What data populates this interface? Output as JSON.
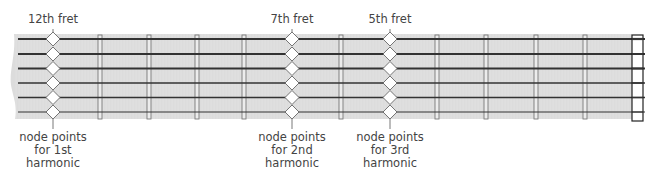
{
  "diagram": {
    "type": "guitar-fretboard-harmonics",
    "colors": {
      "fretboard": "#dcdcdc",
      "string": "#333333",
      "fret": "#7a7a7a",
      "node_fill": "#ffffff",
      "node_stroke": "#555555",
      "text": "#444444",
      "nut_fill": "#ffffff",
      "nut_stroke": "#222222"
    },
    "fretboard": {
      "x0": 12,
      "x1": 632,
      "y0": 34,
      "y1": 119
    },
    "nut": {
      "x": 632,
      "y": 35,
      "width": 11,
      "height": 86
    },
    "strings": [
      {
        "y": 39,
        "width": 2.2
      },
      {
        "y": 54,
        "width": 2.0
      },
      {
        "y": 68.5,
        "width": 1.8
      },
      {
        "y": 83,
        "width": 1.5
      },
      {
        "y": 97.5,
        "width": 1.3
      },
      {
        "y": 112,
        "width": 1.1
      }
    ],
    "frets_x": [
      100,
      149,
      197,
      244,
      341,
      437,
      486,
      536,
      585
    ],
    "node_frets": [
      {
        "fret": "12th fret",
        "x": 53,
        "bottom_label": [
          "node points",
          "for 1st",
          "harmonic"
        ]
      },
      {
        "fret": "7th fret",
        "x": 292,
        "bottom_label": [
          "node points",
          "for 2nd",
          "harmonic"
        ]
      },
      {
        "fret": "5th fret",
        "x": 390,
        "bottom_label": [
          "node points",
          "for 3rd",
          "harmonic"
        ]
      }
    ]
  },
  "labels": {
    "top": {
      "fret12": "12th fret",
      "fret7": "7th fret",
      "fret5": "5th fret"
    },
    "bottom": {
      "h1": {
        "l1": "node points",
        "l2": "for 1st",
        "l3": "harmonic"
      },
      "h2": {
        "l1": "node points",
        "l2": "for 2nd",
        "l3": "harmonic"
      },
      "h3": {
        "l1": "node points",
        "l2": "for 3rd",
        "l3": "harmonic"
      }
    }
  }
}
